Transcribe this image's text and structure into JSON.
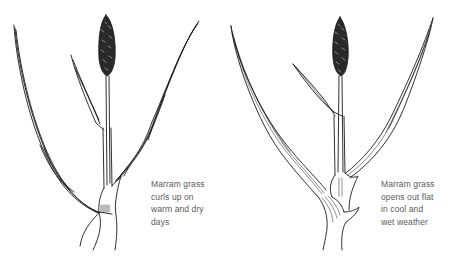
{
  "diagram": {
    "panels": [
      {
        "id": "dry",
        "state": "curled",
        "caption_lines": [
          "Marram grass",
          "curls up on",
          "warm and dry",
          "days"
        ]
      },
      {
        "id": "wet",
        "state": "flat",
        "caption_lines": [
          "Marram grass",
          "opens out flat",
          "in cool and",
          "wet weather"
        ]
      }
    ],
    "colors": {
      "ink": "#1a1a1a",
      "caption": "#5a5a5a",
      "background": "#ffffff"
    }
  }
}
